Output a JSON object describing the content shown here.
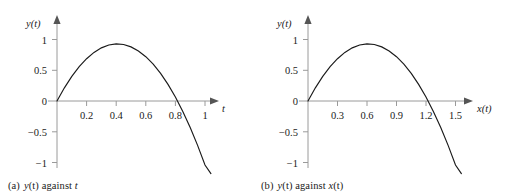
{
  "figure": {
    "background": "#ffffff",
    "curve_color": "#1a1a1a",
    "axis_color": "#9a9a9a",
    "text_color": "#1a1a1a"
  },
  "panels": [
    {
      "id": "a",
      "caption_tag": "(a)",
      "caption_text": "y(t) against t",
      "caption_parts": {
        "var1": "y",
        "paren1": "(t)",
        "middle": " against ",
        "var2": "t"
      }
    },
    {
      "id": "b",
      "caption_tag": "(b)",
      "caption_text": "y(t) against x(t)",
      "caption_parts": {
        "var1": "y",
        "paren1": "(t)",
        "middle": " against ",
        "var2": "x",
        "paren2": "(t)"
      }
    }
  ],
  "chart_data": [
    {
      "type": "line",
      "panel": "a",
      "title": "(a) y(t) against t",
      "xlabel": "t",
      "ylabel": "y(t)",
      "xlim": [
        0,
        1.12
      ],
      "ylim": [
        -1.08,
        1.12
      ],
      "xticks": [
        0.2,
        0.4,
        0.6,
        0.8,
        1
      ],
      "xtick_labels": [
        "0.2",
        "0.4",
        "0.6",
        "0.8",
        "1"
      ],
      "yticks": [
        1,
        0.5,
        0,
        -0.5,
        -1
      ],
      "ytick_labels": [
        "1",
        "0.5",
        "0",
        "-0.5",
        "-1"
      ],
      "grid": false,
      "legend": "none",
      "axis_arrows": true,
      "description": "Downward parabola starting at origin, peaking near y=0.80 at t=0.41, crossing zero near t=0.83, ending near y=-0.97 at t=1.04",
      "peak": {
        "x": 0.41,
        "y": 0.8
      },
      "zero_crossings": [
        0,
        0.83
      ],
      "x": [
        0,
        0.05,
        0.1,
        0.15,
        0.2,
        0.25,
        0.3,
        0.35,
        0.4,
        0.45,
        0.5,
        0.55,
        0.6,
        0.65,
        0.7,
        0.75,
        0.8,
        0.85,
        0.9,
        0.95,
        1.0,
        1.04
      ],
      "y": [
        0,
        0.214,
        0.4,
        0.558,
        0.688,
        0.79,
        0.864,
        0.91,
        0.928,
        0.918,
        0.88,
        0.814,
        0.72,
        0.598,
        0.448,
        0.27,
        0.064,
        -0.17,
        -0.432,
        -0.722,
        -1.04,
        -1.18
      ]
    },
    {
      "type": "line",
      "panel": "b",
      "title": "(b) y(t) against x(t)",
      "xlabel": "x(t)",
      "ylabel": "y(t)",
      "xlim": [
        0,
        1.68
      ],
      "ylim": [
        -1.08,
        1.12
      ],
      "xticks": [
        0.3,
        0.6,
        0.9,
        1.2,
        1.5
      ],
      "xtick_labels": [
        "0.3",
        "0.6",
        "0.9",
        "1.2",
        "1.5"
      ],
      "yticks": [
        1,
        0.5,
        0,
        -0.5,
        -1
      ],
      "ytick_labels": [
        "1",
        "0.5",
        "0",
        "-0.5",
        "-1"
      ],
      "grid": false,
      "legend": "none",
      "axis_arrows": true,
      "description": "Downward parabola starting at origin, peaking near y=0.80 at x=0.61, crossing zero near x=1.24, ending near y=-0.97 at x=1.56",
      "peak": {
        "x": 0.61,
        "y": 0.8
      },
      "zero_crossings": [
        0,
        1.24
      ],
      "x": [
        0,
        0.075,
        0.15,
        0.225,
        0.3,
        0.375,
        0.45,
        0.525,
        0.6,
        0.675,
        0.75,
        0.825,
        0.9,
        0.975,
        1.05,
        1.125,
        1.2,
        1.275,
        1.35,
        1.425,
        1.5,
        1.56
      ],
      "y": [
        0,
        0.214,
        0.4,
        0.558,
        0.688,
        0.79,
        0.864,
        0.91,
        0.928,
        0.918,
        0.88,
        0.814,
        0.72,
        0.598,
        0.448,
        0.27,
        0.064,
        -0.17,
        -0.432,
        -0.722,
        -1.04,
        -1.18
      ]
    }
  ]
}
